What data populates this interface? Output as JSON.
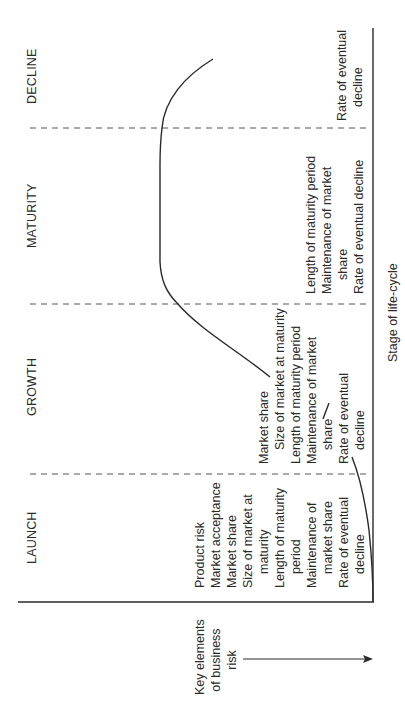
{
  "diagram": {
    "type": "product life-cycle vs business risk (rotated 90°)",
    "stages": [
      {
        "id": "launch",
        "label": "LAUNCH"
      },
      {
        "id": "growth",
        "label": "GROWTH"
      },
      {
        "id": "maturity",
        "label": "MATURITY"
      },
      {
        "id": "decline",
        "label": "DECLINE"
      }
    ],
    "x_axis_label": "Stage of life-cycle",
    "y_axis_label_lines": [
      "Key elements",
      "of business",
      "risk"
    ],
    "risk_elements": {
      "launch": [
        {
          "text": "Product risk",
          "cont": false
        },
        {
          "text": "Market acceptance",
          "cont": false
        },
        {
          "text": "Market share",
          "cont": false
        },
        {
          "text": "Size of market at",
          "cont": false
        },
        {
          "text": "maturity",
          "cont": true
        },
        {
          "text": "Length of maturity",
          "cont": false
        },
        {
          "text": "period",
          "cont": true
        },
        {
          "text": "Maintenance of",
          "cont": false
        },
        {
          "text": "market share",
          "cont": true
        },
        {
          "text": "Rate of eventual",
          "cont": false
        },
        {
          "text": "decline",
          "cont": true
        }
      ],
      "growth": [
        {
          "text": "Market share",
          "cont": false
        },
        {
          "text": "Size of market at maturity",
          "cont": true
        },
        {
          "text": "Length of maturity period",
          "cont": false
        },
        {
          "text": "Maintenance of market",
          "cont": false
        },
        {
          "text": "share",
          "cont": true
        },
        {
          "text": "Rate of eventual",
          "cont": false
        },
        {
          "text": "decline",
          "cont": true
        }
      ],
      "maturity": [
        {
          "text": "Length of maturity period",
          "cont": false
        },
        {
          "text": "Maintenance of market",
          "cont": false
        },
        {
          "text": "share",
          "cont": true
        },
        {
          "text": "Rate of eventual decline",
          "cont": false
        }
      ],
      "decline": [
        {
          "text": "Rate of eventual",
          "cont": false
        },
        {
          "text": "decline",
          "cont": true
        }
      ]
    },
    "colors": {
      "ink": "#2a2a2a",
      "dashed": "#555555",
      "background": "#ffffff"
    }
  }
}
